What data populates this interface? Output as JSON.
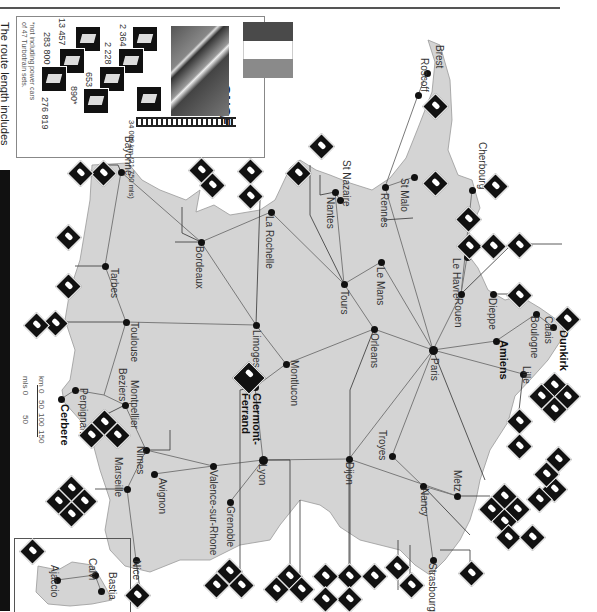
{
  "page": {
    "caption_fragment": "The route length includes",
    "orientation": "rotated 90deg clockwise"
  },
  "legend": {
    "country": "France",
    "operator_logo": "SNCF",
    "flag_colors": [
      "#4a4a4a",
      "#ffffff",
      "#8a8a8a"
    ],
    "route_length": "34 000 km (21 750 mls)",
    "stats": [
      {
        "icon": "passenger-coach-icon",
        "value": "2 364"
      },
      {
        "icon": "passenger-coach-icon",
        "value": "2 228"
      },
      {
        "icon": "railcar-icon",
        "value": "653"
      },
      {
        "icon": "turbotrain-icon",
        "value": "890*"
      },
      {
        "icon": "electric-locomotive-icon",
        "value": "13 457"
      },
      {
        "icon": "freight-wagon-icon",
        "value": "283 800"
      },
      {
        "icon": "staff-icon",
        "value": "276 819"
      }
    ],
    "footnote_line1": "*not including power cars",
    "footnote_line2": "of 47 Turbotrain sets."
  },
  "scale": {
    "km_label": "km 0",
    "km_ticks": [
      "50",
      "100",
      "150"
    ],
    "mls_label": "mls 0",
    "mls_ticks": [
      "50"
    ]
  },
  "map": {
    "land_color": "#d4d4d4",
    "route_color": "#7a7a7a",
    "cities": [
      {
        "name": "Brest",
        "x": 427,
        "y": 73
      },
      {
        "name": "Roscoff",
        "x": 418,
        "y": 95
      },
      {
        "name": "Cherbourg",
        "x": 472,
        "y": 190
      },
      {
        "name": "St Malo",
        "x": 414,
        "y": 177
      },
      {
        "name": "Rennes",
        "x": 385,
        "y": 187
      },
      {
        "name": "St Nazaire",
        "x": 340,
        "y": 200
      },
      {
        "name": "Nantes",
        "x": 335,
        "y": 192
      },
      {
        "name": "Le Mans",
        "x": 381,
        "y": 262
      },
      {
        "name": "Le Havre",
        "x": 467,
        "y": 257
      },
      {
        "name": "Rouen",
        "x": 461,
        "y": 294
      },
      {
        "name": "Dieppe",
        "x": 493,
        "y": 294
      },
      {
        "name": "Calais",
        "x": 536,
        "y": 314
      },
      {
        "name": "Boulogne",
        "x": 519,
        "y": 309
      },
      {
        "name": "Dunkirk",
        "x": 553,
        "y": 327
      },
      {
        "name": "Amiens",
        "x": 496,
        "y": 341
      },
      {
        "name": "Lille",
        "x": 523,
        "y": 374
      },
      {
        "name": "Paris",
        "x": 433,
        "y": 350
      },
      {
        "name": "Tours",
        "x": 344,
        "y": 284
      },
      {
        "name": "Orleans",
        "x": 374,
        "y": 329
      },
      {
        "name": "La Rochelle",
        "x": 271,
        "y": 212
      },
      {
        "name": "Bordeaux",
        "x": 201,
        "y": 242
      },
      {
        "name": "Limoges",
        "x": 256,
        "y": 325
      },
      {
        "name": "Montlucon",
        "x": 286,
        "y": 364
      },
      {
        "name": "Clermont-Ferrand",
        "x": 255,
        "y": 387
      },
      {
        "name": "Bayonne",
        "x": 121,
        "y": 172
      },
      {
        "name": "Tarbes",
        "x": 105,
        "y": 266
      },
      {
        "name": "Toulouse",
        "x": 126,
        "y": 322
      },
      {
        "name": "Beziers",
        "x": 104,
        "y": 395
      },
      {
        "name": "Montpellier",
        "x": 125,
        "y": 405
      },
      {
        "name": "Perpignan",
        "x": 75,
        "y": 390
      },
      {
        "name": "Cerbere",
        "x": 61,
        "y": 399
      },
      {
        "name": "Nimes",
        "x": 146,
        "y": 450
      },
      {
        "name": "Marseille",
        "x": 127,
        "y": 489
      },
      {
        "name": "Avignon",
        "x": 154,
        "y": 474
      },
      {
        "name": "Valence-sur-Rhone",
        "x": 213,
        "y": 466
      },
      {
        "name": "Grenoble",
        "x": 230,
        "y": 502
      },
      {
        "name": "Lyon",
        "x": 263,
        "y": 460
      },
      {
        "name": "Dijon",
        "x": 349,
        "y": 459
      },
      {
        "name": "Troyes",
        "x": 392,
        "y": 456
      },
      {
        "name": "Nancy",
        "x": 423,
        "y": 486
      },
      {
        "name": "Metz",
        "x": 457,
        "y": 496
      },
      {
        "name": "Strasbourg",
        "x": 433,
        "y": 560
      },
      {
        "name": "Nice",
        "x": 136,
        "y": 560
      },
      {
        "name": "Ajaccio",
        "x": 57,
        "y": 580
      },
      {
        "name": "Calvi",
        "x": 95,
        "y": 575
      },
      {
        "name": "Bastia",
        "x": 101,
        "y": 591
      }
    ]
  },
  "colors": {
    "background": "#ffffff",
    "ink": "#111111",
    "land": "#d4d4d4",
    "routes": "#7a7a7a"
  }
}
